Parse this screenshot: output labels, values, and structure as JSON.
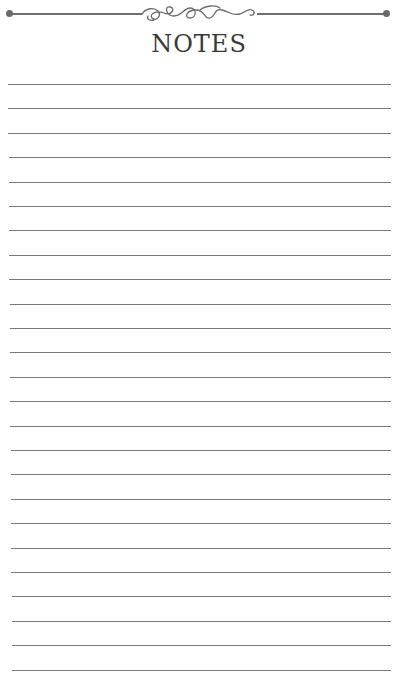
{
  "header": {
    "title": "NOTES",
    "ornament": "flourish-divider"
  },
  "colors": {
    "rule": "#7a7a7a",
    "title": "#3a3a3a",
    "background": "#ffffff"
  },
  "lines": {
    "count": 25,
    "first_y": 84,
    "spacing": 24.4
  }
}
